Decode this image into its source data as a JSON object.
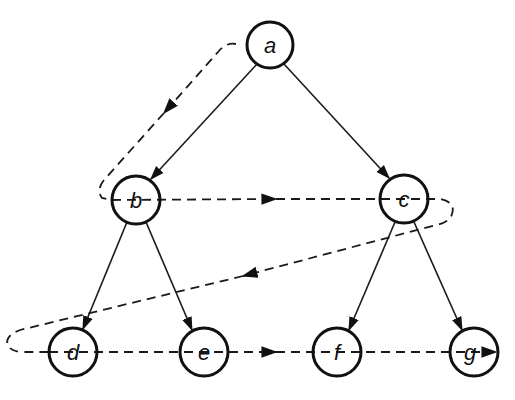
{
  "diagram": {
    "nodes": [
      {
        "id": "a",
        "label": "a",
        "x": 270,
        "y": 45
      },
      {
        "id": "b",
        "label": "b",
        "x": 136,
        "y": 200
      },
      {
        "id": "c",
        "label": "c",
        "x": 404,
        "y": 199
      },
      {
        "id": "d",
        "label": "d",
        "x": 73,
        "y": 352
      },
      {
        "id": "e",
        "label": "e",
        "x": 204,
        "y": 352
      },
      {
        "id": "f",
        "label": "f",
        "x": 337,
        "y": 352
      },
      {
        "id": "g",
        "label": "g",
        "x": 474,
        "y": 352
      }
    ],
    "edges": [
      {
        "from": "a",
        "to": "b"
      },
      {
        "from": "a",
        "to": "c"
      },
      {
        "from": "b",
        "to": "d"
      },
      {
        "from": "b",
        "to": "e"
      },
      {
        "from": "c",
        "to": "f"
      },
      {
        "from": "c",
        "to": "g"
      }
    ],
    "traversal_order": [
      "a",
      "b",
      "c",
      "d",
      "e",
      "f",
      "g"
    ],
    "colors": {
      "stroke": "#111111",
      "background": "#ffffff"
    }
  }
}
